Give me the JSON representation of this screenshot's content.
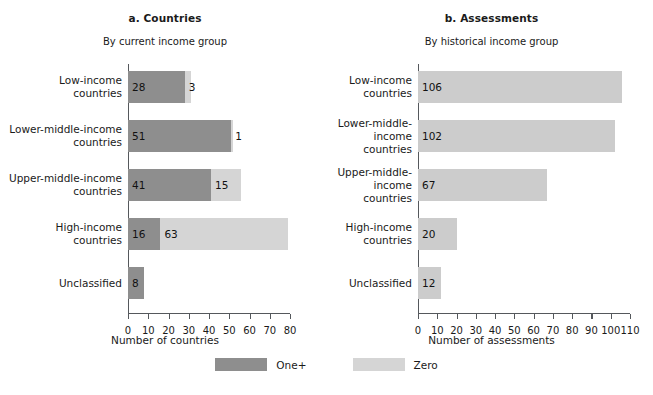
{
  "figure": {
    "legend": {
      "items": [
        {
          "label": "One+",
          "color": "#8e8e8e",
          "swatch_name": "legend-swatch-one-plus"
        },
        {
          "label": "Zero",
          "color": "#d5d5d5",
          "swatch_name": "legend-swatch-zero"
        }
      ]
    }
  },
  "panels": [
    {
      "id": "a",
      "title": "a. Countries",
      "subtitle": "By current income group",
      "xlabel": "Number of countries"
    },
    {
      "id": "b",
      "title": "b. Assessments",
      "subtitle": "By historical income group",
      "xlabel": "Number of assessments"
    }
  ],
  "chart_data": [
    {
      "type": "bar",
      "orientation": "horizontal",
      "stacked": true,
      "title": "a. Countries",
      "subtitle": "By current income group",
      "xlabel": "Number of countries",
      "ylabel": "",
      "xlim": [
        0,
        80
      ],
      "xticks": [
        0,
        10,
        20,
        30,
        40,
        50,
        60,
        70,
        80
      ],
      "grid": false,
      "legend_position": "bottom-center",
      "categories": [
        "Low-income countries",
        "Lower-middle-income countries",
        "Upper-middle-income countries",
        "High-income countries",
        "Unclassified"
      ],
      "series": [
        {
          "name": "One+",
          "color": "#8e8e8e",
          "values": [
            28,
            51,
            41,
            16,
            8
          ]
        },
        {
          "name": "Zero",
          "color": "#d5d5d5",
          "values": [
            3,
            1,
            15,
            63,
            0
          ]
        }
      ]
    },
    {
      "type": "bar",
      "orientation": "horizontal",
      "stacked": false,
      "title": "b. Assessments",
      "subtitle": "By historical income group",
      "xlabel": "Number of assessments",
      "ylabel": "",
      "xlim": [
        0,
        110
      ],
      "xticks": [
        0,
        10,
        20,
        30,
        40,
        50,
        60,
        70,
        80,
        90,
        100,
        110
      ],
      "grid": false,
      "legend_position": "bottom-center",
      "categories": [
        "Low-income countries",
        "Lower-middle-income countries",
        "Upper-middle-income countries",
        "High-income countries",
        "Unclassified"
      ],
      "series": [
        {
          "name": "Assessments",
          "color": "#cccccc",
          "values": [
            106,
            102,
            67,
            20,
            12
          ]
        }
      ]
    }
  ]
}
